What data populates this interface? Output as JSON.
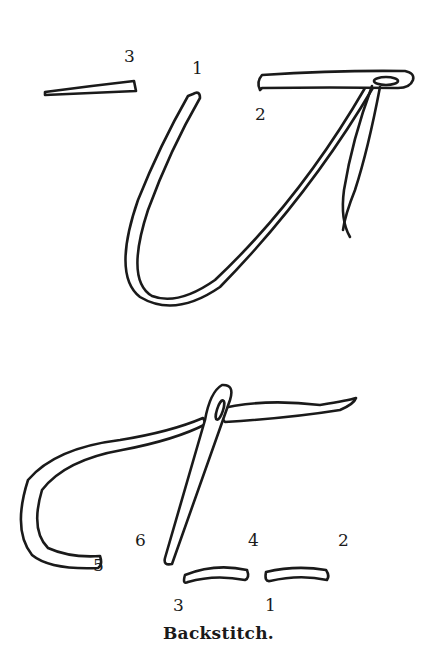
{
  "figure": {
    "caption": "Backstitch.",
    "colors": {
      "ink": "#1a1a1a",
      "paper": "#ffffff"
    },
    "top_diagram": {
      "labels": [
        {
          "id": "top-label-3",
          "text": "3",
          "x": 124,
          "y": 62
        },
        {
          "id": "top-label-1",
          "text": "1",
          "x": 192,
          "y": 74
        },
        {
          "id": "top-label-2",
          "text": "2",
          "x": 255,
          "y": 120
        }
      ]
    },
    "bottom_diagram": {
      "labels": [
        {
          "id": "bottom-label-6",
          "text": "6",
          "x": 135,
          "y": 546
        },
        {
          "id": "bottom-label-4",
          "text": "4",
          "x": 248,
          "y": 546
        },
        {
          "id": "bottom-label-2",
          "text": "2",
          "x": 338,
          "y": 546
        },
        {
          "id": "bottom-label-5",
          "text": "5",
          "x": 93,
          "y": 571
        },
        {
          "id": "bottom-label-3",
          "text": "3",
          "x": 173,
          "y": 611
        },
        {
          "id": "bottom-label-1",
          "text": "1",
          "x": 265,
          "y": 611
        }
      ]
    }
  }
}
